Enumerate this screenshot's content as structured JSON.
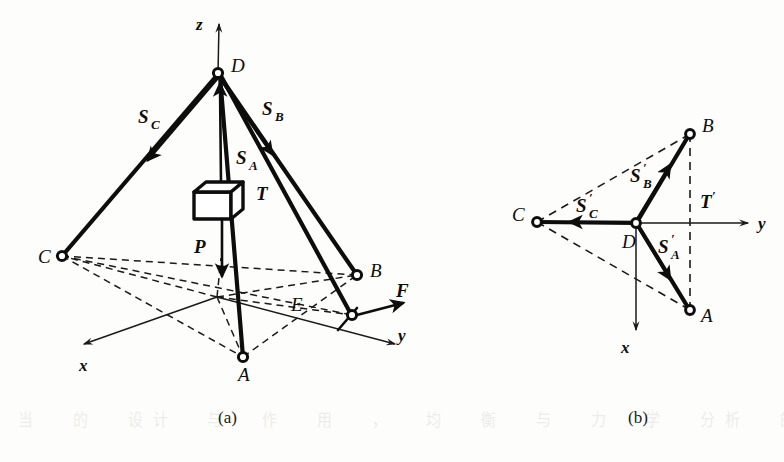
{
  "figure": {
    "caption_a": "(a)",
    "caption_b": "(b)"
  },
  "diagram_a": {
    "axes": {
      "z": "z",
      "x": "x",
      "y": "y"
    },
    "points": {
      "D": "D",
      "A": "A",
      "B": "B",
      "C": "C",
      "E": "E"
    },
    "vectors": {
      "SC_base": "S",
      "SC_sub": "C",
      "SB_base": "S",
      "SB_sub": "B",
      "SA_base": "S",
      "SA_sub": "A",
      "T": "T",
      "P": "P",
      "F": "F"
    }
  },
  "diagram_b": {
    "axes": {
      "x": "x",
      "y": "y"
    },
    "points": {
      "A": "A",
      "B": "B",
      "C": "C",
      "D": "D"
    },
    "vectors": {
      "SCp_base": "S",
      "SCp_sub": "C",
      "SCp_prime": "′",
      "SBp_base": "S",
      "SBp_sub": "B",
      "SBp_prime": "′",
      "SAp_base": "S",
      "SAp_sub": "A",
      "SAp_prime": "′",
      "Tp_base": "T",
      "Tp_prime": "′"
    }
  },
  "colors": {
    "ink": "#0d0d0d",
    "line": "#1a1a1a",
    "paper": "#fdfdfb"
  },
  "bleed_text": {
    "line1": "当 的 设计 与 作 用 ， 均 衡 与 力 学 分析 的 基本 原理"
  }
}
